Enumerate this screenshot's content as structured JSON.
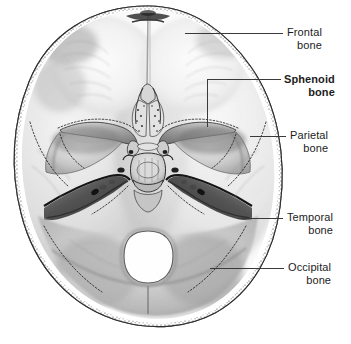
{
  "figure": {
    "view": "superior view of cranial base",
    "background_color": "#ffffff",
    "ink_color": "#1c1c1c",
    "line_color": "#3a3a3a"
  },
  "labels": [
    {
      "id": "frontal",
      "line1": "Frontal",
      "line2": "bone",
      "bold": false,
      "text_x": 287,
      "text_y": 26,
      "leader": {
        "type": "line",
        "x1": 185,
        "y1": 33,
        "x2": 283,
        "y2": 33
      }
    },
    {
      "id": "sphenoid",
      "line1": "Sphenoid",
      "line2": "bone",
      "bold": true,
      "text_x": 284,
      "text_y": 73,
      "leader": {
        "type": "elbow",
        "x1": 207,
        "y1": 127,
        "x2": 207,
        "y2": 79,
        "x3": 281,
        "y3": 79
      }
    },
    {
      "id": "parietal",
      "line1": "Parietal",
      "line2": "bone",
      "bold": false,
      "text_x": 290,
      "text_y": 129,
      "leader": {
        "type": "line",
        "x1": 250,
        "y1": 136,
        "x2": 286,
        "y2": 136
      }
    },
    {
      "id": "temporal",
      "line1": "Temporal",
      "line2": "bone",
      "bold": false,
      "text_x": 287,
      "text_y": 211,
      "leader": {
        "type": "line",
        "x1": 238,
        "y1": 218,
        "x2": 283,
        "y2": 218
      }
    },
    {
      "id": "occipital",
      "line1": "Occipital",
      "line2": "bone",
      "bold": false,
      "text_x": 288,
      "text_y": 261,
      "leader": {
        "type": "line",
        "x1": 210,
        "y1": 268,
        "x2": 284,
        "y2": 268
      }
    }
  ],
  "anatomy": {
    "foramen_magnum": {
      "cx": 148,
      "cy": 257,
      "rx": 24,
      "ry": 26
    },
    "regions": [
      "anterior cranial fossa",
      "middle cranial fossa",
      "posterior cranial fossa",
      "crista galli",
      "cribriform plate",
      "sella turcica",
      "lesser wing of sphenoid",
      "greater wing of sphenoid",
      "petrous ridge of temporal bone",
      "foramen magnum",
      "diploe of cut cranial vault"
    ]
  }
}
